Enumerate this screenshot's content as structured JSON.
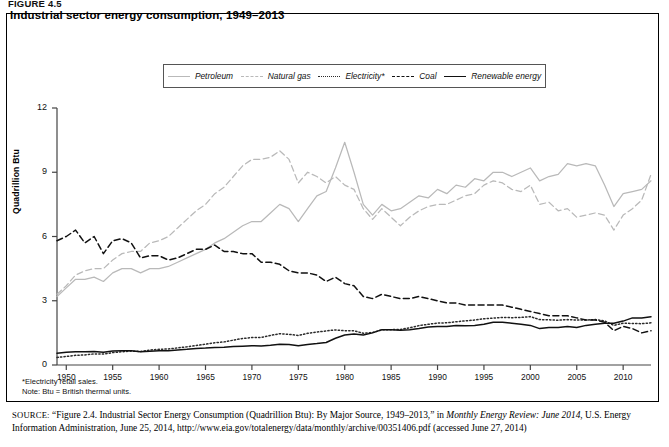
{
  "figure_label": "FIGURE 4.5",
  "chart_title": "Industrial sector energy consumption, 1949–2013",
  "axis": {
    "ylabel": "Quadrillion Btu",
    "yticks": [
      "0",
      "3",
      "6",
      "9",
      "12"
    ],
    "xticks": [
      "1950",
      "1955",
      "1960",
      "1965",
      "1970",
      "1975",
      "1980",
      "1985",
      "1990",
      "1995",
      "2000",
      "2005",
      "2010"
    ]
  },
  "legend": {
    "items": [
      {
        "label": "Petroleum",
        "icon": "line-solid-gray-icon",
        "color": "#b9b9b9",
        "style": "solid"
      },
      {
        "label": "Natural gas",
        "icon": "line-dashed-gray-icon",
        "color": "#b9b9b9",
        "style": "dashed"
      },
      {
        "label": "Electricity*",
        "icon": "line-dotted-black-icon",
        "color": "#2b2b2b",
        "style": "dotted"
      },
      {
        "label": "Coal",
        "icon": "line-dashed-black-icon",
        "color": "#111111",
        "style": "dashed"
      },
      {
        "label": "Renewable energy",
        "icon": "line-solid-black-icon",
        "color": "#111111",
        "style": "solid"
      }
    ]
  },
  "notes": {
    "footnote": "*Electricity retail sales.",
    "note": "Note: Btu = British thermal units."
  },
  "source": {
    "prefix": "SOURCE:",
    "text_1": "“Figure 2.4. Industrial Sector Energy Consumption (Quadrillion Btu): By Major Source, 1949–2013,” in ",
    "italic_1": "Monthly Energy Review: June 2014",
    "text_2": ", U.S. Energy Information Administration, June 25, 2014, http://www.eia.gov/totalenergy/data/monthly/archive/00351406.pdf (accessed June 27, 2014)"
  },
  "chart_data": {
    "type": "line",
    "title": "Industrial sector energy consumption, 1949–2013",
    "xlabel": "",
    "ylabel": "Quadrillion Btu",
    "xlim": [
      1949,
      2013
    ],
    "ylim": [
      0,
      12
    ],
    "grid": false,
    "legend_position": "top-center",
    "x": [
      1949,
      1950,
      1951,
      1952,
      1953,
      1954,
      1955,
      1956,
      1957,
      1958,
      1959,
      1960,
      1961,
      1962,
      1963,
      1964,
      1965,
      1966,
      1967,
      1968,
      1969,
      1970,
      1971,
      1972,
      1973,
      1974,
      1975,
      1976,
      1977,
      1978,
      1979,
      1980,
      1981,
      1982,
      1983,
      1984,
      1985,
      1986,
      1987,
      1988,
      1989,
      1990,
      1991,
      1992,
      1993,
      1994,
      1995,
      1996,
      1997,
      1998,
      1999,
      2000,
      2001,
      2002,
      2003,
      2004,
      2005,
      2006,
      2007,
      2008,
      2009,
      2010,
      2011,
      2012,
      2013
    ],
    "series": [
      {
        "name": "Petroleum",
        "color": "#b9b9b9",
        "style": "solid",
        "values": [
          3.2,
          3.6,
          4.0,
          4.0,
          4.1,
          3.9,
          4.3,
          4.5,
          4.5,
          4.3,
          4.5,
          4.5,
          4.6,
          4.8,
          5.0,
          5.2,
          5.4,
          5.7,
          5.9,
          6.2,
          6.5,
          6.7,
          6.7,
          7.1,
          7.5,
          7.3,
          6.7,
          7.3,
          7.9,
          8.1,
          9.2,
          10.4,
          9.0,
          7.5,
          7.0,
          7.5,
          7.2,
          7.3,
          7.6,
          7.9,
          7.8,
          8.2,
          8.0,
          8.4,
          8.3,
          8.7,
          8.6,
          9.0,
          9.0,
          8.8,
          9.0,
          9.2,
          8.6,
          8.8,
          8.9,
          9.4,
          9.3,
          9.4,
          9.3,
          8.4,
          7.4,
          8.0,
          8.1,
          8.2,
          8.6
        ]
      },
      {
        "name": "Natural gas",
        "color": "#b9b9b9",
        "style": "dashed",
        "values": [
          3.3,
          3.7,
          4.2,
          4.4,
          4.5,
          4.5,
          4.9,
          5.2,
          5.3,
          5.3,
          5.7,
          5.8,
          6.0,
          6.4,
          6.8,
          7.2,
          7.5,
          8.0,
          8.3,
          8.8,
          9.3,
          9.6,
          9.6,
          9.7,
          10.0,
          9.6,
          8.5,
          9.0,
          8.8,
          8.5,
          8.8,
          8.4,
          8.2,
          7.3,
          6.8,
          7.3,
          6.9,
          6.5,
          6.9,
          7.2,
          7.4,
          7.5,
          7.5,
          7.7,
          7.9,
          8.0,
          8.4,
          8.6,
          8.5,
          8.2,
          8.1,
          8.4,
          7.5,
          7.6,
          7.2,
          7.3,
          6.9,
          7.0,
          7.1,
          7.0,
          6.3,
          7.0,
          7.3,
          7.7,
          8.9
        ]
      },
      {
        "name": "Electricity*",
        "color": "#2b2b2b",
        "style": "dotted",
        "values": [
          0.35,
          0.4,
          0.45,
          0.47,
          0.52,
          0.51,
          0.58,
          0.62,
          0.65,
          0.63,
          0.7,
          0.73,
          0.75,
          0.8,
          0.85,
          0.91,
          0.97,
          1.04,
          1.08,
          1.16,
          1.24,
          1.28,
          1.29,
          1.38,
          1.46,
          1.43,
          1.38,
          1.48,
          1.54,
          1.59,
          1.64,
          1.6,
          1.6,
          1.48,
          1.52,
          1.64,
          1.65,
          1.66,
          1.74,
          1.84,
          1.9,
          1.96,
          1.97,
          2.02,
          2.06,
          2.1,
          2.16,
          2.19,
          2.22,
          2.21,
          2.22,
          2.26,
          2.12,
          2.11,
          2.09,
          2.12,
          2.1,
          2.1,
          2.12,
          2.06,
          1.85,
          1.95,
          1.94,
          1.93,
          1.97
        ]
      },
      {
        "name": "Coal",
        "color": "#111111",
        "style": "dashed",
        "values": [
          5.8,
          6.0,
          6.3,
          5.7,
          6.0,
          5.2,
          5.8,
          5.9,
          5.7,
          5.0,
          5.1,
          5.1,
          4.9,
          5.0,
          5.2,
          5.4,
          5.4,
          5.6,
          5.3,
          5.3,
          5.2,
          5.2,
          4.8,
          4.8,
          4.7,
          4.4,
          4.3,
          4.3,
          4.2,
          3.9,
          4.1,
          3.8,
          3.7,
          3.2,
          3.1,
          3.3,
          3.2,
          3.1,
          3.1,
          3.2,
          3.1,
          3.0,
          2.9,
          2.9,
          2.8,
          2.8,
          2.8,
          2.8,
          2.8,
          2.7,
          2.6,
          2.5,
          2.4,
          2.3,
          2.3,
          2.3,
          2.2,
          2.1,
          2.1,
          2.0,
          1.6,
          1.8,
          1.7,
          1.5,
          1.6
        ]
      },
      {
        "name": "Renewable energy",
        "color": "#111111",
        "style": "solid",
        "values": [
          0.55,
          0.6,
          0.62,
          0.62,
          0.63,
          0.6,
          0.65,
          0.66,
          0.66,
          0.62,
          0.64,
          0.66,
          0.67,
          0.7,
          0.73,
          0.77,
          0.79,
          0.82,
          0.83,
          0.86,
          0.88,
          0.9,
          0.89,
          0.92,
          0.97,
          0.96,
          0.9,
          0.96,
          1.0,
          1.05,
          1.25,
          1.4,
          1.45,
          1.4,
          1.5,
          1.65,
          1.65,
          1.62,
          1.65,
          1.7,
          1.77,
          1.8,
          1.8,
          1.85,
          1.83,
          1.85,
          1.9,
          2.0,
          2.0,
          1.95,
          1.9,
          1.85,
          1.7,
          1.75,
          1.75,
          1.8,
          1.75,
          1.85,
          1.9,
          1.95,
          1.95,
          2.05,
          2.2,
          2.2,
          2.25
        ]
      }
    ]
  }
}
